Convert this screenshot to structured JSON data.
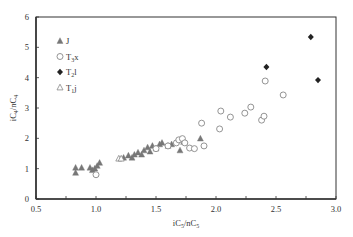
{
  "chart_data": {
    "type": "scatter",
    "title": "",
    "xlabel": "iC5/nC5",
    "ylabel": "iC4/nC4",
    "xlabel_parts": [
      {
        "t": "iC"
      },
      {
        "t": "5",
        "sub": true
      },
      {
        "t": "/nC"
      },
      {
        "t": "5",
        "sub": true
      }
    ],
    "ylabel_parts": [
      {
        "t": "iC"
      },
      {
        "t": "4",
        "sub": true
      },
      {
        "t": "/nC"
      },
      {
        "t": "4",
        "sub": true
      }
    ],
    "xlim": [
      0.5,
      3.0
    ],
    "ylim": [
      0,
      6
    ],
    "xticks": [
      "0.5",
      "1.0",
      "1.5",
      "2.0",
      "2.5",
      "3.0"
    ],
    "yticks": [
      "0",
      "1",
      "2",
      "3",
      "4",
      "5",
      "6"
    ],
    "x_minor_step": 0.25,
    "grid": false,
    "legend_position": "top-left",
    "series": [
      {
        "name": "J",
        "label_parts": [
          {
            "t": "J"
          }
        ],
        "marker": "triangle-filled",
        "color": "#777777",
        "points": [
          [
            0.83,
            1.03
          ],
          [
            0.83,
            0.86
          ],
          [
            0.88,
            1.03
          ],
          [
            0.95,
            1.03
          ],
          [
            0.97,
            0.95
          ],
          [
            0.99,
            1.0
          ],
          [
            1.01,
            1.09
          ],
          [
            1.03,
            1.19
          ],
          [
            1.23,
            1.36
          ],
          [
            1.27,
            1.43
          ],
          [
            1.3,
            1.36
          ],
          [
            1.32,
            1.46
          ],
          [
            1.35,
            1.53
          ],
          [
            1.38,
            1.46
          ],
          [
            1.4,
            1.6
          ],
          [
            1.43,
            1.7
          ],
          [
            1.45,
            1.56
          ],
          [
            1.47,
            1.75
          ],
          [
            1.5,
            1.66
          ],
          [
            1.53,
            1.8
          ],
          [
            1.55,
            1.85
          ],
          [
            1.6,
            1.75
          ],
          [
            1.63,
            1.8
          ],
          [
            1.7,
            1.6
          ],
          [
            1.73,
            1.88
          ],
          [
            1.87,
            1.99
          ]
        ]
      },
      {
        "name": "T3x",
        "label_parts": [
          {
            "t": "T"
          },
          {
            "t": "3",
            "sub": true
          },
          {
            "t": "x"
          }
        ],
        "marker": "circle-open",
        "color": "#888888",
        "points": [
          [
            1.0,
            0.8
          ],
          [
            1.5,
            1.66
          ],
          [
            1.6,
            1.75
          ],
          [
            1.67,
            1.85
          ],
          [
            1.69,
            1.95
          ],
          [
            1.72,
            1.99
          ],
          [
            1.74,
            1.85
          ],
          [
            1.78,
            1.68
          ],
          [
            1.82,
            1.66
          ],
          [
            1.9,
            1.75
          ],
          [
            1.88,
            2.5
          ],
          [
            2.03,
            2.31
          ],
          [
            2.04,
            2.9
          ],
          [
            2.12,
            2.7
          ],
          [
            2.24,
            2.83
          ],
          [
            2.29,
            3.03
          ],
          [
            2.38,
            2.6
          ],
          [
            2.4,
            2.73
          ],
          [
            2.41,
            3.89
          ],
          [
            2.56,
            3.43
          ]
        ]
      },
      {
        "name": "T2l",
        "label_parts": [
          {
            "t": "T"
          },
          {
            "t": "2",
            "sub": true
          },
          {
            "t": "l"
          }
        ],
        "marker": "diamond-filled",
        "color": "#222222",
        "points": [
          [
            2.42,
            4.35
          ],
          [
            2.79,
            5.34
          ],
          [
            2.85,
            3.92
          ]
        ]
      },
      {
        "name": "T1j",
        "label_parts": [
          {
            "t": "T"
          },
          {
            "t": "1",
            "sub": true
          },
          {
            "t": "j"
          }
        ],
        "marker": "triangle-open",
        "color": "#888888",
        "points": [
          [
            1.19,
            1.33
          ],
          [
            1.21,
            1.33
          ]
        ]
      }
    ]
  }
}
